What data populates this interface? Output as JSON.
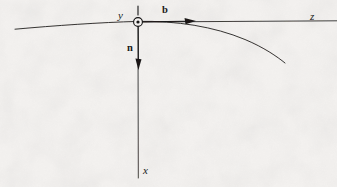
{
  "figure": {
    "kind": "line-diagram",
    "background_color": "#f3f1ef",
    "ink_color": "#1a1a1a",
    "width": 337,
    "height": 187,
    "labels": {
      "y_axis": "y",
      "z_axis": "z",
      "x_axis": "x",
      "binormal_vector": "b",
      "normal_vector": "n"
    },
    "label_positions": {
      "y_axis": [
        118,
        10
      ],
      "z_axis": [
        310,
        11
      ],
      "x_axis": [
        143,
        165
      ],
      "binormal_vector": [
        162,
        5
      ],
      "normal_vector": [
        127,
        43
      ]
    },
    "origin": {
      "x": 138,
      "y": 22,
      "marker": "circle-dot-out-of-page",
      "radius": 4.5
    },
    "axes": [
      {
        "name": "z-axis",
        "orientation": "horizontal",
        "from": [
          138,
          22
        ],
        "to": [
          336,
          21
        ],
        "arrow": false
      },
      {
        "name": "x-axis",
        "orientation": "vertical-down",
        "from": [
          138,
          22
        ],
        "to": [
          138,
          178
        ],
        "arrow": false
      }
    ],
    "vectors": [
      {
        "name": "b",
        "from": [
          138,
          22
        ],
        "to": [
          196,
          21
        ],
        "arrowhead": true,
        "direction": "right"
      },
      {
        "name": "n",
        "from": [
          138,
          22
        ],
        "to": [
          138,
          70
        ],
        "arrowhead": true,
        "direction": "down"
      }
    ],
    "tick_above_origin": {
      "x": 138,
      "from_y": 6,
      "to_y": 15
    },
    "curve": {
      "name": "trajectory-curve",
      "start": [
        15,
        29
      ],
      "apex": [
        138,
        21
      ],
      "end": [
        285,
        63
      ],
      "path": "M 15 29.2 C 55 25.6, 100 22.4, 138 21.4 C 176 20.6, 214 26.5, 245 39.5 C 264 47.5, 277 56.5, 285 63"
    }
  }
}
